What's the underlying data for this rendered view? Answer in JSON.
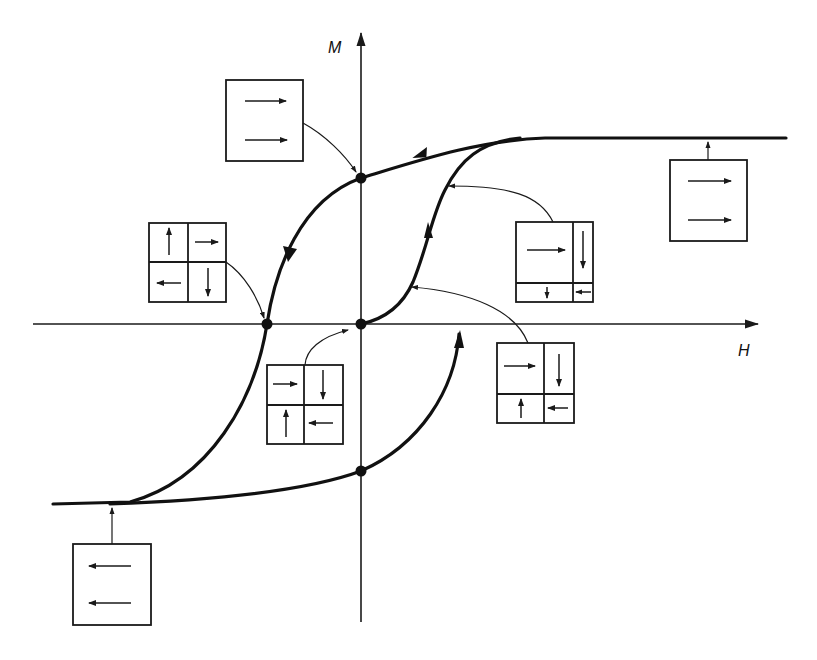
{
  "figure": {
    "title": ""
  },
  "axes": {
    "x_label": "H",
    "y_label": "M"
  },
  "colors": {
    "ink": "#111111",
    "background": "#ffffff"
  },
  "points": [
    {
      "name": "remanence-positive",
      "x": 361,
      "y": 178
    },
    {
      "name": "coercive-negative",
      "x": 267,
      "y": 324
    },
    {
      "name": "origin",
      "x": 361,
      "y": 324
    },
    {
      "name": "remanence-negative",
      "x": 361,
      "y": 471
    }
  ],
  "insets": [
    {
      "name": "remanence-inset",
      "layout": "single-domain",
      "moments": [
        "right",
        "right"
      ],
      "points_to": "remanence-positive"
    },
    {
      "name": "coercive-inset",
      "layout": "four-domain",
      "moments": [
        "up",
        "right",
        "left",
        "down"
      ],
      "points_to": "coercive-negative"
    },
    {
      "name": "demagnetized-inset",
      "layout": "four-domain",
      "moments": [
        "right",
        "down",
        "up",
        "left"
      ],
      "points_to": "virgin-curve-start"
    },
    {
      "name": "domain-growth-inset-small",
      "layout": "four-domain-unequal",
      "moments": [
        "right",
        "down",
        "up",
        "left"
      ],
      "points_to": "virgin-curve-low"
    },
    {
      "name": "domain-growth-inset-large",
      "layout": "four-domain-unequal",
      "moments": [
        "right",
        "down",
        "down",
        "left"
      ],
      "points_to": "virgin-curve-high"
    },
    {
      "name": "positive-saturation-inset",
      "layout": "single-domain",
      "moments": [
        "right",
        "right"
      ],
      "points_to": "positive-saturation"
    },
    {
      "name": "negative-saturation-inset",
      "layout": "single-domain",
      "moments": [
        "left",
        "left"
      ],
      "points_to": "negative-saturation"
    }
  ]
}
